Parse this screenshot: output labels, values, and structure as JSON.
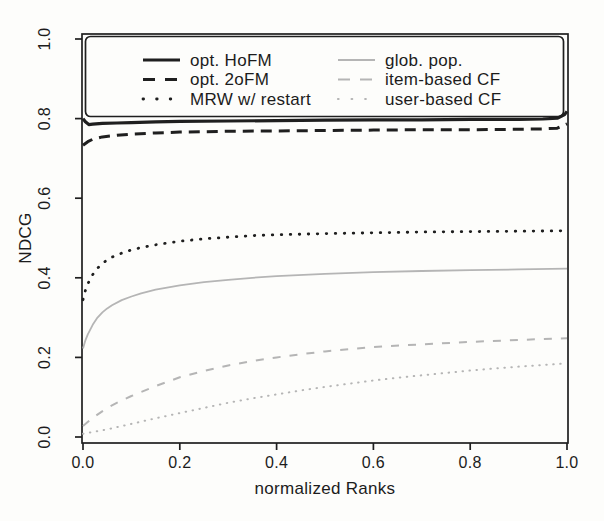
{
  "chart_data": {
    "type": "line",
    "title": "",
    "grid": false,
    "colors": {
      "ink": "#1f1f1f",
      "gray": "#b5b5b5",
      "paper": "#fdfdfb"
    },
    "x_axis": {
      "label": "normalized Ranks",
      "range": [
        0,
        1
      ],
      "tick_values": [
        0,
        0.2,
        0.4,
        0.6,
        0.8,
        1
      ],
      "tick_labels": [
        "0.0",
        "0.2",
        "0.4",
        "0.6",
        "0.8",
        "1.0"
      ]
    },
    "y_axis": {
      "label": "NDCG",
      "range": [
        0,
        1
      ],
      "tick_values": [
        0,
        0.2,
        0.4,
        0.6,
        0.8,
        1
      ],
      "tick_labels": [
        "0.0",
        "0.2",
        "0.4",
        "0.6",
        "0.8",
        "1.0"
      ]
    },
    "legend": {
      "position": "top-inside",
      "columns": [
        [
          "opt. HoFM",
          "opt. 2oFM",
          "MRW w/ restart"
        ],
        [
          "glob. pop.",
          "item-based CF",
          "user-based CF"
        ]
      ]
    },
    "series": [
      {
        "name": "glob. pop.",
        "color": "#b5b5b5",
        "line_style": "solid",
        "stroke_width": 1.8,
        "points": [
          [
            0,
            0.222
          ],
          [
            0.005,
            0.243
          ],
          [
            0.01,
            0.258
          ],
          [
            0.02,
            0.282
          ],
          [
            0.03,
            0.3
          ],
          [
            0.04,
            0.313
          ],
          [
            0.05,
            0.323
          ],
          [
            0.06,
            0.331
          ],
          [
            0.08,
            0.344
          ],
          [
            0.1,
            0.353
          ],
          [
            0.12,
            0.361
          ],
          [
            0.15,
            0.37
          ],
          [
            0.2,
            0.381
          ],
          [
            0.25,
            0.389
          ],
          [
            0.3,
            0.395
          ],
          [
            0.35,
            0.4
          ],
          [
            0.4,
            0.404
          ],
          [
            0.5,
            0.41
          ],
          [
            0.6,
            0.414
          ],
          [
            0.7,
            0.417
          ],
          [
            0.8,
            0.419
          ],
          [
            0.9,
            0.421
          ],
          [
            1,
            0.423
          ]
        ]
      },
      {
        "name": "item-based CF",
        "color": "#b5b5b5",
        "line_style": "dashed",
        "stroke_width": 2,
        "points": [
          [
            0,
            0.028
          ],
          [
            0.02,
            0.048
          ],
          [
            0.05,
            0.073
          ],
          [
            0.08,
            0.092
          ],
          [
            0.1,
            0.103
          ],
          [
            0.15,
            0.128
          ],
          [
            0.2,
            0.15
          ],
          [
            0.25,
            0.166
          ],
          [
            0.3,
            0.18
          ],
          [
            0.35,
            0.191
          ],
          [
            0.4,
            0.2
          ],
          [
            0.45,
            0.208
          ],
          [
            0.5,
            0.215
          ],
          [
            0.6,
            0.226
          ],
          [
            0.7,
            0.233
          ],
          [
            0.8,
            0.239
          ],
          [
            0.9,
            0.244
          ],
          [
            1,
            0.248
          ]
        ]
      },
      {
        "name": "user-based CF",
        "color": "#b5b5b5",
        "line_style": "dotted",
        "stroke_width": 2,
        "points": [
          [
            0,
            0.008
          ],
          [
            0.05,
            0.019
          ],
          [
            0.1,
            0.033
          ],
          [
            0.15,
            0.047
          ],
          [
            0.2,
            0.06
          ],
          [
            0.25,
            0.073
          ],
          [
            0.3,
            0.086
          ],
          [
            0.35,
            0.097
          ],
          [
            0.4,
            0.107
          ],
          [
            0.45,
            0.117
          ],
          [
            0.5,
            0.126
          ],
          [
            0.55,
            0.134
          ],
          [
            0.6,
            0.142
          ],
          [
            0.65,
            0.149
          ],
          [
            0.7,
            0.155
          ],
          [
            0.75,
            0.161
          ],
          [
            0.8,
            0.167
          ],
          [
            0.85,
            0.172
          ],
          [
            0.9,
            0.177
          ],
          [
            0.95,
            0.181
          ],
          [
            1,
            0.185
          ]
        ]
      },
      {
        "name": "MRW w/ restart",
        "color": "#1f1f1f",
        "line_style": "dotted",
        "stroke_width": 2.8,
        "points": [
          [
            0,
            0.345
          ],
          [
            0.005,
            0.368
          ],
          [
            0.01,
            0.385
          ],
          [
            0.02,
            0.408
          ],
          [
            0.03,
            0.424
          ],
          [
            0.04,
            0.436
          ],
          [
            0.05,
            0.445
          ],
          [
            0.06,
            0.452
          ],
          [
            0.08,
            0.462
          ],
          [
            0.1,
            0.47
          ],
          [
            0.12,
            0.476
          ],
          [
            0.15,
            0.483
          ],
          [
            0.2,
            0.492
          ],
          [
            0.25,
            0.498
          ],
          [
            0.3,
            0.502
          ],
          [
            0.35,
            0.506
          ],
          [
            0.4,
            0.508
          ],
          [
            0.5,
            0.511
          ],
          [
            0.6,
            0.513
          ],
          [
            0.7,
            0.515
          ],
          [
            0.8,
            0.516
          ],
          [
            0.9,
            0.517
          ],
          [
            1,
            0.518
          ]
        ]
      },
      {
        "name": "opt. 2oFM",
        "color": "#1f1f1f",
        "line_style": "dashed",
        "stroke_width": 3,
        "points": [
          [
            0,
            0.733
          ],
          [
            0.01,
            0.742
          ],
          [
            0.02,
            0.748
          ],
          [
            0.04,
            0.754
          ],
          [
            0.07,
            0.758
          ],
          [
            0.1,
            0.761
          ],
          [
            0.15,
            0.764
          ],
          [
            0.2,
            0.766
          ],
          [
            0.3,
            0.768
          ],
          [
            0.4,
            0.769
          ],
          [
            0.5,
            0.77
          ],
          [
            0.6,
            0.771
          ],
          [
            0.7,
            0.772
          ],
          [
            0.8,
            0.772
          ],
          [
            0.9,
            0.773
          ],
          [
            0.95,
            0.774
          ],
          [
            0.98,
            0.776
          ],
          [
            1,
            0.787
          ]
        ]
      },
      {
        "name": "opt. HoFM",
        "color": "#1f1f1f",
        "line_style": "solid",
        "stroke_width": 3.2,
        "points": [
          [
            0,
            0.8
          ],
          [
            0.005,
            0.792
          ],
          [
            0.012,
            0.785
          ],
          [
            0.02,
            0.786
          ],
          [
            0.04,
            0.788
          ],
          [
            0.07,
            0.789
          ],
          [
            0.1,
            0.79
          ],
          [
            0.15,
            0.792
          ],
          [
            0.2,
            0.793
          ],
          [
            0.3,
            0.794
          ],
          [
            0.4,
            0.795
          ],
          [
            0.5,
            0.796
          ],
          [
            0.6,
            0.797
          ],
          [
            0.7,
            0.797
          ],
          [
            0.8,
            0.798
          ],
          [
            0.9,
            0.798
          ],
          [
            0.95,
            0.799
          ],
          [
            0.98,
            0.801
          ],
          [
            0.995,
            0.81
          ],
          [
            1,
            0.818
          ]
        ]
      }
    ]
  }
}
